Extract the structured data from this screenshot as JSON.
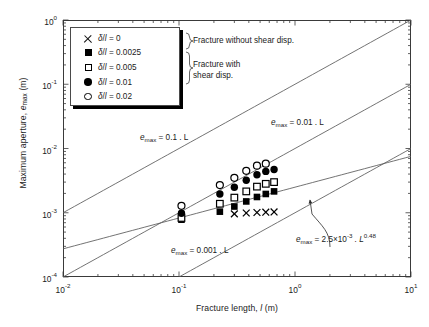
{
  "chart_data": {
    "type": "scatter",
    "title": "",
    "xlabel": "Fracture length, l (m)",
    "ylabel": "Maximum aperture, e_max (m)",
    "xlabel_parts": {
      "prefix": "Fracture length, ",
      "symbol": "l",
      "suffix": " (m)"
    },
    "ylabel_parts": {
      "prefix": "Maximum aperture, ",
      "symbol": "e",
      "sub": "max",
      "suffix": " (m)"
    },
    "xscale": "log",
    "yscale": "log",
    "xlim": [
      0.01,
      10
    ],
    "ylim": [
      0.0001,
      1
    ],
    "grid": false,
    "legend_position": "top-left-inside",
    "xticks": [
      {
        "value": 0.01,
        "mantissa": "10",
        "exponent": "-2"
      },
      {
        "value": 0.1,
        "mantissa": "10",
        "exponent": "-1"
      },
      {
        "value": 1,
        "mantissa": "10",
        "exponent": "0"
      },
      {
        "value": 10,
        "mantissa": "10",
        "exponent": "1"
      }
    ],
    "yticks": [
      {
        "value": 0.0001,
        "mantissa": "10",
        "exponent": "-4"
      },
      {
        "value": 0.001,
        "mantissa": "10",
        "exponent": "-3"
      },
      {
        "value": 0.01,
        "mantissa": "10",
        "exponent": "-2"
      },
      {
        "value": 0.1,
        "mantissa": "10",
        "exponent": "-1"
      },
      {
        "value": 1,
        "mantissa": "10",
        "exponent": "0"
      }
    ],
    "series": [
      {
        "name": "delta/l = 0",
        "legend_label": "δ/l = 0",
        "marker": "cross",
        "group": "Fracture without shear disp.",
        "points": [
          {
            "x": 0.3,
            "y": 0.00096
          },
          {
            "x": 0.38,
            "y": 0.00099
          },
          {
            "x": 0.47,
            "y": 0.00101
          },
          {
            "x": 0.56,
            "y": 0.00102
          },
          {
            "x": 0.66,
            "y": 0.00103
          }
        ]
      },
      {
        "name": "delta/l = 0.0025",
        "legend_label": "δ/l = 0.0025",
        "marker": "filled-square",
        "group": "Fracture with shear disp.",
        "points": [
          {
            "x": 0.105,
            "y": 0.00078
          },
          {
            "x": 0.225,
            "y": 0.00104
          },
          {
            "x": 0.3,
            "y": 0.00125
          },
          {
            "x": 0.38,
            "y": 0.0015
          },
          {
            "x": 0.47,
            "y": 0.00176
          },
          {
            "x": 0.56,
            "y": 0.00196
          },
          {
            "x": 0.66,
            "y": 0.00215
          }
        ]
      },
      {
        "name": "delta/l = 0.005",
        "legend_label": "δ/l = 0.005",
        "marker": "open-square",
        "group": "Fracture with shear disp.",
        "points": [
          {
            "x": 0.105,
            "y": 0.00083
          },
          {
            "x": 0.225,
            "y": 0.00138
          },
          {
            "x": 0.3,
            "y": 0.00172
          },
          {
            "x": 0.38,
            "y": 0.00215
          },
          {
            "x": 0.47,
            "y": 0.00255
          },
          {
            "x": 0.56,
            "y": 0.00282
          },
          {
            "x": 0.66,
            "y": 0.003
          }
        ]
      },
      {
        "name": "delta/l = 0.01",
        "legend_label": "δ/l = 0.01",
        "marker": "filled-circle",
        "group": "Fracture with shear disp.",
        "points": [
          {
            "x": 0.105,
            "y": 0.00098
          },
          {
            "x": 0.225,
            "y": 0.00196
          },
          {
            "x": 0.3,
            "y": 0.0025
          },
          {
            "x": 0.38,
            "y": 0.0032
          },
          {
            "x": 0.47,
            "y": 0.0039
          },
          {
            "x": 0.56,
            "y": 0.0044
          },
          {
            "x": 0.66,
            "y": 0.0047
          }
        ]
      },
      {
        "name": "delta/l = 0.02",
        "legend_label": "δ/l = 0.02",
        "marker": "open-circle",
        "group": "Fracture with shear disp.",
        "points": [
          {
            "x": 0.105,
            "y": 0.00128
          },
          {
            "x": 0.225,
            "y": 0.0027
          },
          {
            "x": 0.3,
            "y": 0.0035
          },
          {
            "x": 0.38,
            "y": 0.0045
          },
          {
            "x": 0.47,
            "y": 0.0054
          },
          {
            "x": 0.56,
            "y": 0.0058
          }
        ]
      }
    ],
    "reference_lines": [
      {
        "id": "e01",
        "label": "e_max = 0.1 . L",
        "slope": 1,
        "intercept": 0.1
      },
      {
        "id": "e001",
        "label": "e_max = 0.01 . L",
        "slope": 1,
        "intercept": 0.01
      },
      {
        "id": "e0001",
        "label": "e_max = 0.001 . L",
        "slope": 1,
        "intercept": 0.001
      },
      {
        "id": "epower",
        "label": "e_max = 2.5x10^-3 . L^0.48",
        "slope": 0.48,
        "intercept": 0.0025
      }
    ],
    "annotations": [
      {
        "id": "no-shear",
        "text": "Fracture without shear disp."
      },
      {
        "id": "shear",
        "text": "Fracture with shear disp.",
        "line1": "Fracture with",
        "line2": "shear disp."
      }
    ]
  },
  "axes": {
    "y_title_prefix": "Maximum aperture, ",
    "y_title_symbol": "e",
    "y_title_sub": "max",
    "y_title_suffix": " (m)",
    "x_title_prefix": "Fracture length, ",
    "x_title_symbol": "l",
    "x_title_suffix": " (m)"
  },
  "legend": {
    "rows": [
      {
        "marker": "cross",
        "label": "δ/l = 0",
        "delta_over_l": "0"
      },
      {
        "marker": "filled-square",
        "label": "δ/l = 0.0025",
        "delta_over_l": "0.0025"
      },
      {
        "marker": "open-square",
        "label": "δ/l = 0.005",
        "delta_over_l": "0.005"
      },
      {
        "marker": "filled-circle",
        "label": "δ/l = 0.01",
        "delta_over_l": "0.01"
      },
      {
        "marker": "open-circle",
        "label": "δ/l = 0.02",
        "delta_over_l": "0.02"
      }
    ],
    "symbol_numerator": "δ",
    "symbol_denominator": "l"
  },
  "annotations": {
    "no_shear": "Fracture without shear disp.",
    "shear_line1": "Fracture with",
    "shear_line2": "shear disp."
  },
  "equations": {
    "e01": {
      "lhs": "e",
      "sub": "max",
      "rhs": " = 0.1 . L"
    },
    "e001": {
      "lhs": "e",
      "sub": "max",
      "rhs": " = 0.01 . L"
    },
    "e0001": {
      "lhs": "e",
      "sub": "max",
      "rhs": " = 0.001 . L"
    },
    "epower": {
      "lhs": "e",
      "sub": "max",
      "mid": " = 2.5×10",
      "exp1": "-3",
      "mid2": " . L",
      "exp2": "0.48"
    }
  },
  "colors": {
    "axis": "#3a3a3a",
    "marker": "#000000",
    "line": "#5a5a5a",
    "background": "#ffffff",
    "text": "#1a1a1a"
  }
}
